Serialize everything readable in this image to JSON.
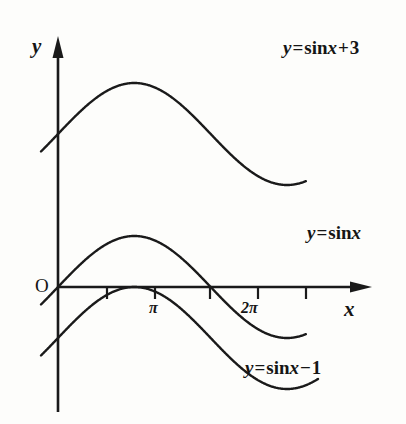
{
  "figure": {
    "background_color": "#fdfdfb",
    "ink_color": "#1a1a1a",
    "axes": {
      "y_axis_label": "y",
      "x_axis_label": "x",
      "origin_label": "O",
      "x_axis_y_px": 287,
      "y_axis_x_px": 58,
      "x_axis_start_px": 58,
      "x_axis_end_px": 372,
      "y_axis_top_px": 36,
      "y_axis_bottom_px": 412
    },
    "ticks": [
      {
        "label": "",
        "x_px": 107,
        "value": "pi/2"
      },
      {
        "label": "π",
        "x_px": 155,
        "value": "pi"
      },
      {
        "label": "",
        "x_px": 210,
        "value": "3pi/2"
      },
      {
        "label": "2π",
        "x_px": 258,
        "value": "2pi"
      },
      {
        "label": "",
        "x_px": 306,
        "value": "5pi/2"
      }
    ],
    "curve_labels": [
      {
        "name": "sin-x-plus-3",
        "text": "y = sin x + 3",
        "lhs": "y",
        "equals": "=",
        "fn": "sin",
        "arg": "x",
        "operator": "+",
        "constant": "3",
        "x_px": 283,
        "y_px": 38
      },
      {
        "name": "sin-x",
        "text": "y = sin x",
        "lhs": "y",
        "equals": "=",
        "fn": "sin",
        "arg": "x",
        "operator": "",
        "constant": "",
        "x_px": 307,
        "y_px": 223
      },
      {
        "name": "sin-x-minus-1",
        "text": "y = sin x − 1",
        "lhs": "y",
        "equals": "=",
        "fn": "sin",
        "arg": "x",
        "operator": "−",
        "constant": "1",
        "x_px": 245,
        "y_px": 358
      }
    ]
  },
  "chart_data": {
    "type": "line",
    "title": "",
    "subtitle": "",
    "xlabel": "x",
    "ylabel": "y",
    "grid": false,
    "legend_position": "inline-annotations",
    "x_unit": "radians",
    "xlim": [
      -0.35,
      6.55
    ],
    "ylim": [
      -2.45,
      4.45
    ],
    "x_ticks": [
      {
        "value": 1.5708,
        "label": ""
      },
      {
        "value": 3.1416,
        "label": "π"
      },
      {
        "value": 4.7124,
        "label": ""
      },
      {
        "value": 6.2832,
        "label": "2π"
      },
      {
        "value": 7.854,
        "label": ""
      }
    ],
    "pixels_per_unit_x": 48.6,
    "pixels_per_unit_y": 51,
    "series": [
      {
        "name": "y = sin x + 3",
        "formula": "sin(x) + 3",
        "offset": 3,
        "amplitude": 1,
        "period": 6.2832,
        "x_start": -0.35,
        "x_end": 5.1,
        "color": "#1a1a1a",
        "line_width": 2.4,
        "key_points": [
          {
            "x": -0.35,
            "y": 2.657
          },
          {
            "x": 1.5708,
            "y": 4
          },
          {
            "x": 3.1416,
            "y": 3
          },
          {
            "x": 4.7124,
            "y": 2
          },
          {
            "x": 5.1,
            "y": 2.075
          }
        ]
      },
      {
        "name": "y = sin x",
        "formula": "sin(x)",
        "offset": 0,
        "amplitude": 1,
        "period": 6.2832,
        "x_start": -0.35,
        "x_end": 5.1,
        "color": "#1a1a1a",
        "line_width": 2.4,
        "key_points": [
          {
            "x": -0.35,
            "y": -0.343
          },
          {
            "x": 0,
            "y": 0
          },
          {
            "x": 1.5708,
            "y": 1
          },
          {
            "x": 3.1416,
            "y": 0
          },
          {
            "x": 4.7124,
            "y": -1
          },
          {
            "x": 5.1,
            "y": -0.925
          }
        ]
      },
      {
        "name": "y = sin x − 1",
        "formula": "sin(x) - 1",
        "offset": -1,
        "amplitude": 1,
        "period": 6.2832,
        "x_start": -0.35,
        "x_end": 5.35,
        "color": "#1a1a1a",
        "line_width": 2.4,
        "key_points": [
          {
            "x": -0.35,
            "y": -1.343
          },
          {
            "x": 1.5708,
            "y": 0
          },
          {
            "x": 3.1416,
            "y": -1
          },
          {
            "x": 4.7124,
            "y": -2
          },
          {
            "x": 5.35,
            "y": -1.2
          }
        ]
      }
    ]
  }
}
